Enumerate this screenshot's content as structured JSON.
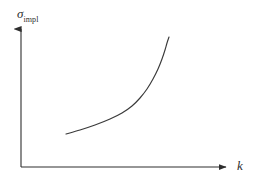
{
  "figure": {
    "kind": "line-diagram",
    "background_color": "#ffffff",
    "stroke_color": "#3a3a3a",
    "axis_color": "#2e2e2e",
    "y_axis_label_symbol": "σ",
    "y_axis_label_subscript": "impl",
    "x_axis_label": "k"
  },
  "chart_data": {
    "type": "line",
    "title": "",
    "subtitle": "",
    "xlabel": "k",
    "ylabel": "σimpl",
    "grid": false,
    "legend": null,
    "axis_ticks": {
      "x": [],
      "y": []
    },
    "axes": {
      "x_arrow": true,
      "y_arrow": true,
      "origin_px": [
        21,
        167
      ],
      "x_end_px": [
        232,
        167
      ],
      "y_end_px": [
        21,
        24
      ]
    },
    "xlim": [
      0,
      1
    ],
    "ylim": [
      0,
      1
    ],
    "annotations": [],
    "series": [
      {
        "name": "implied volatility smile",
        "shape": "monotonic increasing convex with steep asymptotic rise",
        "points_px": [
          [
            66,
            134
          ],
          [
            80,
            130
          ],
          [
            95,
            125
          ],
          [
            110,
            119
          ],
          [
            122,
            113
          ],
          [
            132,
            106
          ],
          [
            140,
            98
          ],
          [
            147,
            89
          ],
          [
            153,
            79
          ],
          [
            158,
            69
          ],
          [
            162,
            59
          ],
          [
            165,
            50
          ],
          [
            167,
            43
          ],
          [
            169,
            37
          ]
        ]
      }
    ]
  }
}
